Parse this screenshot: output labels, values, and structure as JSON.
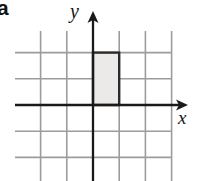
{
  "figure": {
    "part_label": "a",
    "background_color": "#ffffff"
  },
  "axes": {
    "x_label": "x",
    "y_label": "y",
    "axis_color": "#1a1a1a",
    "origin_px": {
      "x": 93,
      "y": 105
    },
    "cell_size_px": 26.2,
    "x_axis_arrow_tip_px": 188,
    "y_axis_arrow_tip_px": 11
  },
  "grid": {
    "color": "#9c9c9c",
    "left_px": 15,
    "top_px": 31,
    "right_px": 172,
    "bottom_px": 181,
    "columns": 6,
    "rows": 6,
    "x_range": [
      -3,
      3
    ],
    "y_range": [
      -3.9,
      2.8
    ]
  },
  "shape": {
    "name": "shaded-rectangle",
    "fill_color": "#ebeae8",
    "stroke_color": "#2b2b2b",
    "x_from": 0,
    "x_to": 1,
    "y_from": 0,
    "y_to": 2,
    "width_units": 1,
    "height_units": 2,
    "px": {
      "left": 93,
      "top": 52.6,
      "width": 26.2,
      "height": 52.4
    }
  }
}
